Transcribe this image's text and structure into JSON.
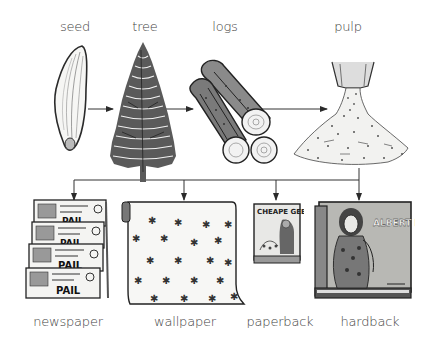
{
  "diagram": {
    "type": "flow",
    "top_row": [
      {
        "id": "seed",
        "label": "seed",
        "icon": "seed-icon"
      },
      {
        "id": "tree",
        "label": "tree",
        "icon": "pine-tree-icon"
      },
      {
        "id": "logs",
        "label": "logs",
        "icon": "logs-icon"
      },
      {
        "id": "pulp",
        "label": "pulp",
        "icon": "pulp-pile-icon"
      }
    ],
    "bottom_row": [
      {
        "id": "newspaper",
        "label": "newspaper",
        "icon": "newspaper-stack-icon"
      },
      {
        "id": "wallpaper",
        "label": "wallpaper",
        "icon": "wallpaper-roll-icon"
      },
      {
        "id": "paperback",
        "label": "paperback",
        "icon": "paperback-book-icon"
      },
      {
        "id": "hardback",
        "label": "hardback",
        "icon": "hardback-book-icon"
      }
    ],
    "edges": [
      {
        "from": "seed",
        "to": "tree"
      },
      {
        "from": "tree",
        "to": "logs"
      },
      {
        "from": "logs",
        "to": "pulp"
      },
      {
        "from": "pulp",
        "to": "newspaper"
      },
      {
        "from": "pulp",
        "to": "wallpaper"
      },
      {
        "from": "pulp",
        "to": "paperback"
      },
      {
        "from": "pulp",
        "to": "hardback"
      }
    ],
    "paperback_cover_text": "CHEAPE GEB",
    "hardback_cover_text": "ALBERT KLIMT",
    "colors": {
      "line": "#333333",
      "ink": "#2a2a2a",
      "paper": "#f4f4f2",
      "book_cover": "#b8b8b4"
    }
  }
}
